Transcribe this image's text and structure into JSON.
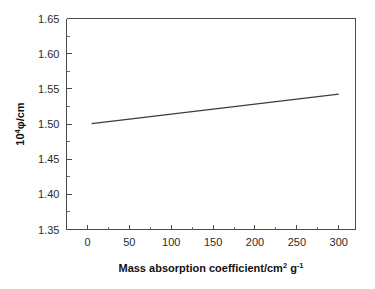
{
  "chart_data": {
    "type": "line",
    "title": "",
    "subtitle": "",
    "xlabel_parts": {
      "main": "Mass absorption coefficient/cm",
      "sup1": "2",
      "mid": " g",
      "sup2": "-1"
    },
    "xlabel": "Mass absorption coefficient/cm2 g-1",
    "ylabel_parts": {
      "base": "10",
      "sup": "4",
      "rest": "φ/cm"
    },
    "ylabel": "10⁴φ/cm",
    "xlim": [
      -25,
      320
    ],
    "ylim": [
      1.35,
      1.65
    ],
    "xticks": [
      0,
      50,
      100,
      150,
      200,
      250,
      300
    ],
    "xtick_labels": [
      "0",
      "50",
      "100",
      "150",
      "200",
      "250",
      "300"
    ],
    "yticks": [
      1.35,
      1.4,
      1.45,
      1.5,
      1.55,
      1.6,
      1.65
    ],
    "ytick_labels": [
      "1.35",
      "1.40",
      "1.45",
      "1.50",
      "1.55",
      "1.60",
      "1.65"
    ],
    "x_minor_ticks": [
      25,
      75,
      125,
      175,
      225,
      275
    ],
    "y_minor_ticks": [
      1.375,
      1.425,
      1.475,
      1.525,
      1.575,
      1.625
    ],
    "grid": false,
    "legend": false,
    "legend_position": "none",
    "series": [
      {
        "name": "fit line",
        "x": [
          5,
          300
        ],
        "y": [
          1.5005,
          1.5425
        ],
        "color": "#3c3c3c",
        "style": "solid",
        "markers": false
      }
    ],
    "colors": {
      "line": "#3c3c3c",
      "axis": "#4a4a4a",
      "text": "#2b2b2b",
      "title_text": "#111111",
      "background": "#ffffff"
    }
  }
}
